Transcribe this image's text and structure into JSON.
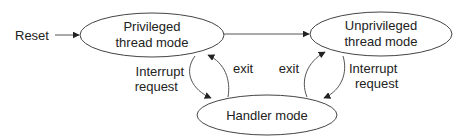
{
  "diagram": {
    "type": "state-machine",
    "colors": {
      "stroke": "#444444",
      "text": "#222222",
      "background": "#ffffff"
    },
    "entry": {
      "label": "Reset"
    },
    "states": [
      {
        "id": "privileged",
        "line1": "Privileged",
        "line2": "thread mode"
      },
      {
        "id": "unprivileged",
        "line1": "Unprivileged",
        "line2": "thread mode"
      },
      {
        "id": "handler",
        "line1": "Handler mode"
      }
    ],
    "transitions": [
      {
        "from": "reset",
        "to": "privileged",
        "label": ""
      },
      {
        "from": "privileged",
        "to": "unprivileged",
        "label": ""
      },
      {
        "from": "privileged",
        "to": "handler",
        "line1": "Interrupt",
        "line2": "request"
      },
      {
        "from": "handler",
        "to": "privileged",
        "label": "exit"
      },
      {
        "from": "handler",
        "to": "unprivileged",
        "label": "exit"
      },
      {
        "from": "unprivileged",
        "to": "handler",
        "line1": "Interrupt",
        "line2": "request"
      }
    ]
  }
}
